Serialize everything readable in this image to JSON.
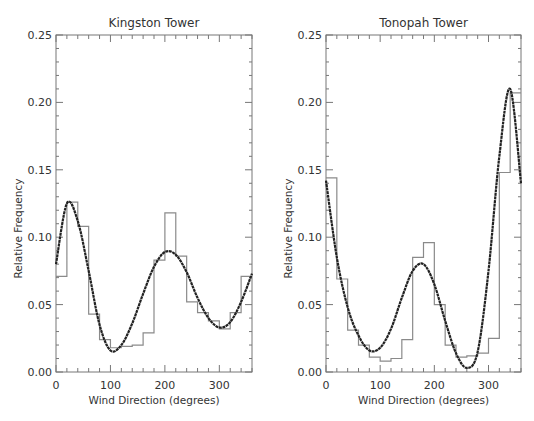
{
  "chart_data": [
    {
      "type": "line",
      "title": "Kingston Tower",
      "xlabel": "Wind Direction (degrees)",
      "ylabel": "Relative Frequency",
      "xlim": [
        0,
        360
      ],
      "ylim": [
        0,
        0.25
      ],
      "xticks": [
        "0",
        "100",
        "200",
        "300"
      ],
      "yticks": [
        "0.00",
        "0.05",
        "0.10",
        "0.15",
        "0.20",
        "0.25"
      ],
      "grid": false,
      "series": [
        {
          "name": "histogram",
          "style": "step",
          "bin_width": 20,
          "bin_starts": [
            0,
            20,
            40,
            60,
            80,
            100,
            120,
            140,
            160,
            180,
            200,
            220,
            240,
            260,
            280,
            300,
            320,
            340
          ],
          "values": [
            0.071,
            0.126,
            0.108,
            0.043,
            0.024,
            0.018,
            0.019,
            0.02,
            0.029,
            0.083,
            0.118,
            0.086,
            0.052,
            0.044,
            0.038,
            0.032,
            0.044,
            0.071
          ]
        },
        {
          "name": "fitted curve",
          "style": "smooth",
          "x": [
            0,
            20,
            40,
            60,
            80,
            100,
            120,
            140,
            160,
            180,
            200,
            220,
            240,
            260,
            280,
            300,
            320,
            340,
            360
          ],
          "values": [
            0.08,
            0.125,
            0.112,
            0.075,
            0.035,
            0.016,
            0.02,
            0.036,
            0.058,
            0.078,
            0.089,
            0.087,
            0.074,
            0.055,
            0.04,
            0.033,
            0.037,
            0.052,
            0.073
          ]
        }
      ]
    },
    {
      "type": "line",
      "title": "Tonopah Tower",
      "xlabel": "Wind Direction (degrees)",
      "ylabel": "Relative Frequency",
      "xlim": [
        0,
        360
      ],
      "ylim": [
        0,
        0.25
      ],
      "xticks": [
        "0",
        "100",
        "200",
        "300"
      ],
      "yticks": [
        "0.00",
        "0.05",
        "0.10",
        "0.15",
        "0.20",
        "0.25"
      ],
      "grid": false,
      "series": [
        {
          "name": "histogram",
          "style": "step",
          "bin_width": 20,
          "bin_starts": [
            0,
            20,
            40,
            60,
            80,
            100,
            120,
            140,
            160,
            180,
            200,
            220,
            240,
            260,
            280,
            300,
            320,
            340
          ],
          "values": [
            0.144,
            0.069,
            0.031,
            0.02,
            0.011,
            0.008,
            0.01,
            0.024,
            0.085,
            0.096,
            0.05,
            0.02,
            0.011,
            0.012,
            0.014,
            0.025,
            0.148,
            0.207
          ]
        },
        {
          "name": "fitted curve",
          "style": "smooth",
          "x": [
            0,
            20,
            40,
            60,
            80,
            100,
            120,
            140,
            160,
            180,
            200,
            220,
            240,
            260,
            280,
            300,
            320,
            340,
            360
          ],
          "values": [
            0.142,
            0.085,
            0.048,
            0.027,
            0.016,
            0.018,
            0.032,
            0.055,
            0.075,
            0.08,
            0.065,
            0.038,
            0.014,
            0.003,
            0.015,
            0.075,
            0.16,
            0.21,
            0.14
          ]
        }
      ]
    }
  ]
}
